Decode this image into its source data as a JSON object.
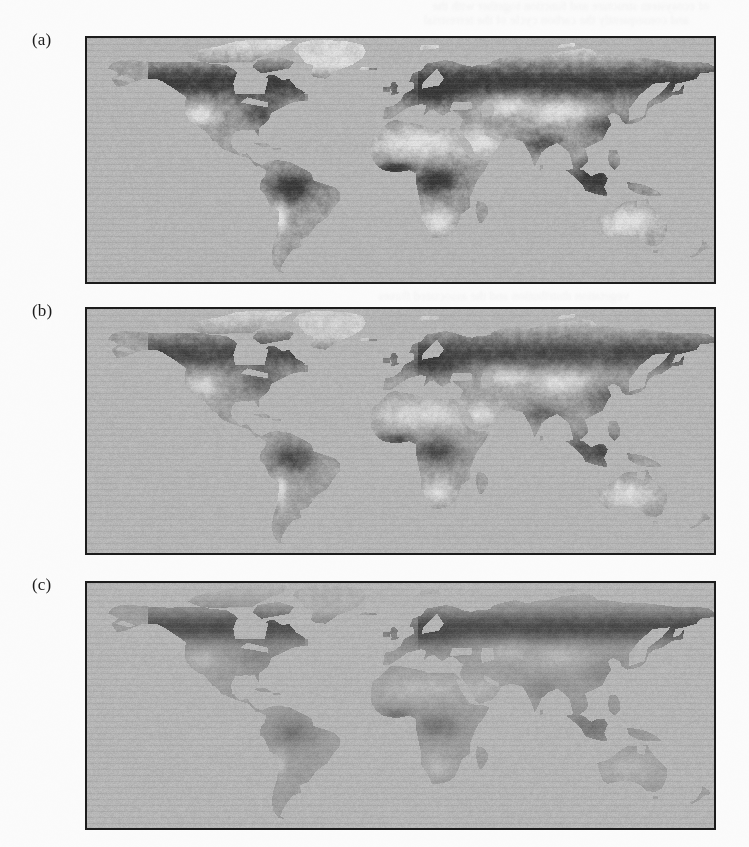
{
  "page": {
    "background_color": "#fbfbfb",
    "width": 749,
    "height": 847,
    "show_through_text": "faint mirrored text bleeding through from the reverse side of the scanned page (illegible)"
  },
  "figure": {
    "type": "multi-panel-map-figure",
    "projection": "equirectangular / plate-carrée world map",
    "colormap": "grayscale",
    "frame_color": "#1c1c1c",
    "panels": [
      {
        "label": "(a)",
        "name": "panel-a",
        "variant": "dense",
        "description": "Global land-cover map, panel a — most extensive dark (high value) vegetation cover: boreal forest belt, Amazon, Congo, SE Asia, eastern North America all rendered dark.",
        "frame": {
          "left": 85,
          "top": 36,
          "width": 631,
          "height": 248
        }
      },
      {
        "label": "(b)",
        "name": "panel-b",
        "variant": "medium",
        "description": "Global land-cover map, panel b — intermediate extent: dark boreal belt and tropical forests retained but reduced; mid-tone land dominates the interiors.",
        "frame": {
          "left": 85,
          "top": 307,
          "width": 631,
          "height": 248
        }
      },
      {
        "label": "(c)",
        "name": "panel-c",
        "variant": "sparse",
        "description": "Global land-cover map, panel c — sparsest: land is largely uniform mid-grey, dark tones persist only in the high-latitude boreal band of North America and Eurasia.",
        "frame": {
          "left": 85,
          "top": 581,
          "width": 631,
          "height": 249
        }
      }
    ]
  },
  "chart_data": {
    "type": "heatmap",
    "title": "",
    "subtitle": "",
    "xlabel": "Longitude",
    "ylabel": "Latitude",
    "xlim": [
      -180,
      180
    ],
    "ylim": [
      -60,
      84
    ],
    "grid": false,
    "legend": "none",
    "colormap": "grayscale",
    "panel_labels": [
      "(a)",
      "(b)",
      "(c)"
    ],
    "tone_levels": [
      {
        "name": "ocean",
        "hex": "#b4b4b4",
        "value": 0,
        "label": "Ocean / no data"
      },
      {
        "name": "bare-ice",
        "hex": "#d9d9d9",
        "value": 0.05,
        "label": "Ice, desert, bare ground (very low)"
      },
      {
        "name": "sparse-land",
        "hex": "#a0a0a0",
        "value": 0.25,
        "label": "Sparse / semi-arid cover"
      },
      {
        "name": "moderate-land",
        "hex": "#8c8c8c",
        "value": 0.5,
        "label": "Moderate cover"
      },
      {
        "name": "dense-land",
        "hex": "#6a6a6a",
        "value": 0.75,
        "label": "Dense cover"
      },
      {
        "name": "very-dense-land",
        "hex": "#454545",
        "value": 1.0,
        "label": "Very dense forest cover (highest)"
      }
    ],
    "regional_values": {
      "categories": [
        "Boreal North America",
        "Eastern North America",
        "Western North America",
        "Amazon Basin",
        "Southern South America",
        "Sahara",
        "Congo Basin",
        "Southern Africa",
        "Europe",
        "Boreal Eurasia (Siberia)",
        "Central Asia",
        "South Asia",
        "Southeast Asia",
        "Australia",
        "Greenland"
      ],
      "series": [
        {
          "name": "(a)",
          "values": [
            1.0,
            0.85,
            0.6,
            1.0,
            0.45,
            0.05,
            1.0,
            0.5,
            0.75,
            1.0,
            0.45,
            0.75,
            1.0,
            0.4,
            0.05
          ]
        },
        {
          "name": "(b)",
          "values": [
            0.85,
            0.6,
            0.45,
            0.8,
            0.4,
            0.05,
            0.85,
            0.45,
            0.55,
            0.85,
            0.4,
            0.55,
            0.9,
            0.4,
            0.05
          ]
        },
        {
          "name": "(c)",
          "values": [
            0.7,
            0.45,
            0.42,
            0.48,
            0.4,
            0.05,
            0.55,
            0.42,
            0.45,
            0.7,
            0.4,
            0.45,
            0.7,
            0.4,
            0.05
          ]
        }
      ]
    }
  }
}
